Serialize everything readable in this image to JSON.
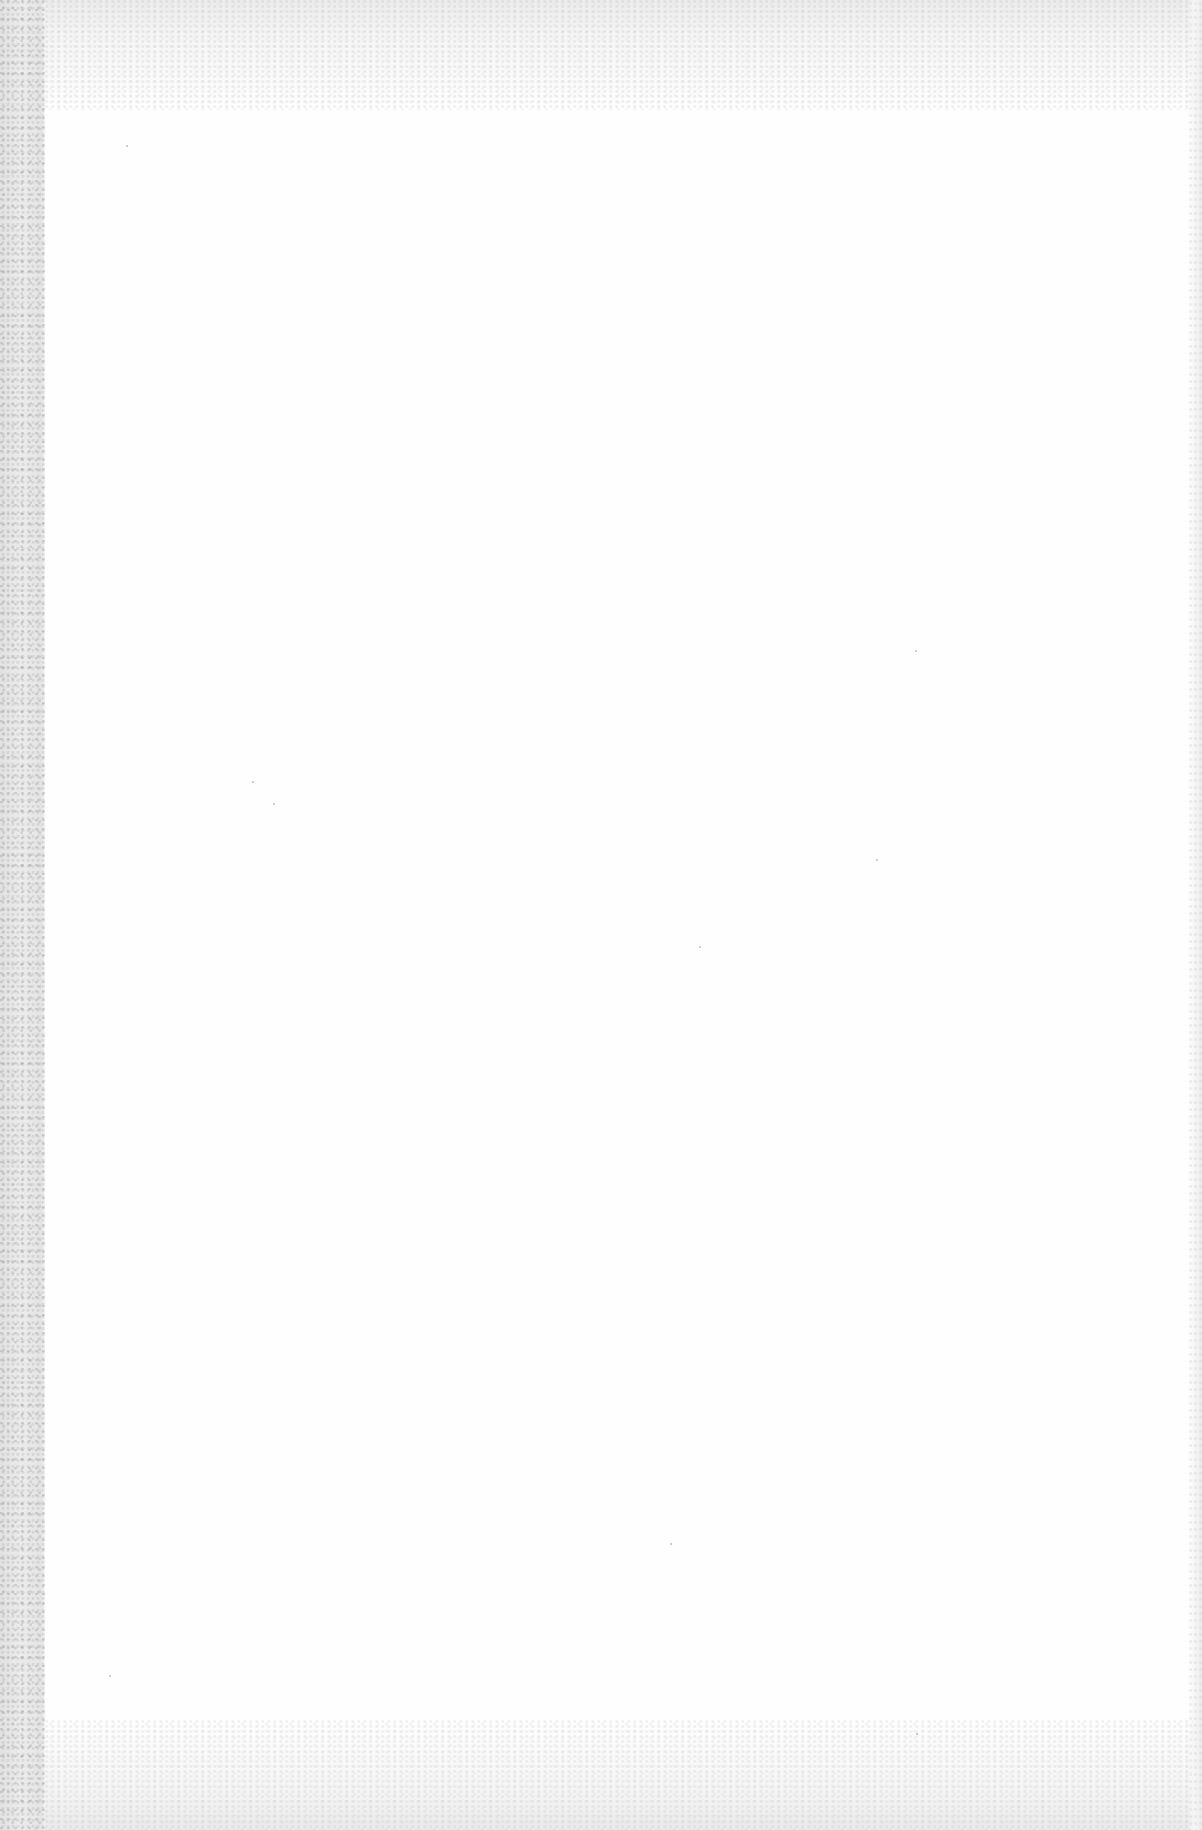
{
  "document": {
    "type": "scanned-page",
    "content": "",
    "is_blank": true
  },
  "colors": {
    "paper": "#fefefe",
    "gutter": "#e6e6e6",
    "edge_noise": "#ececec"
  }
}
